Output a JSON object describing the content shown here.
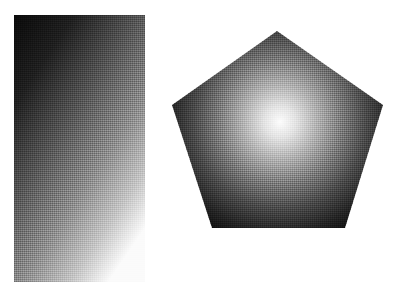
{
  "canvas": {
    "width": 407,
    "height": 292,
    "background_color": "#ffffff",
    "texture": "halftone-dither"
  },
  "shapes": [
    {
      "id": "rectangle",
      "type": "rectangle",
      "label": "Linear gradient rectangle",
      "x": 14,
      "y": 15,
      "width": 131,
      "height": 267,
      "gradient": {
        "kind": "linear",
        "angle_deg": 160,
        "direction": "top-left to bottom-right",
        "stops": [
          {
            "offset": "0%",
            "color": "#0a0a0a"
          },
          {
            "offset": "22%",
            "color": "#1f1f1f"
          },
          {
            "offset": "45%",
            "color": "#545454"
          },
          {
            "offset": "68%",
            "color": "#8d8d8d"
          },
          {
            "offset": "86%",
            "color": "#c4c4c4"
          },
          {
            "offset": "100%",
            "color": "#fbfbfb"
          }
        ]
      }
    },
    {
      "id": "pentagon",
      "type": "pentagon",
      "label": "Radial gradient pentagon",
      "points": [
        {
          "x": 277,
          "y": 31
        },
        {
          "x": 383,
          "y": 105
        },
        {
          "x": 345,
          "y": 228
        },
        {
          "x": 212,
          "y": 228
        },
        {
          "x": 172,
          "y": 105
        }
      ],
      "points_attr": "277,31 383,105 345,228 212,228 172,105",
      "gradient": {
        "kind": "radial",
        "center_x": 280,
        "center_y": 122,
        "radius": 135,
        "stops": [
          {
            "offset": "0%",
            "color": "#fdfdfd"
          },
          {
            "offset": "12%",
            "color": "#e2e2e2"
          },
          {
            "offset": "28%",
            "color": "#b0b0b0"
          },
          {
            "offset": "46%",
            "color": "#7a7a7a"
          },
          {
            "offset": "64%",
            "color": "#4a4a4a"
          },
          {
            "offset": "82%",
            "color": "#242424"
          },
          {
            "offset": "100%",
            "color": "#070707"
          }
        ]
      }
    }
  ]
}
